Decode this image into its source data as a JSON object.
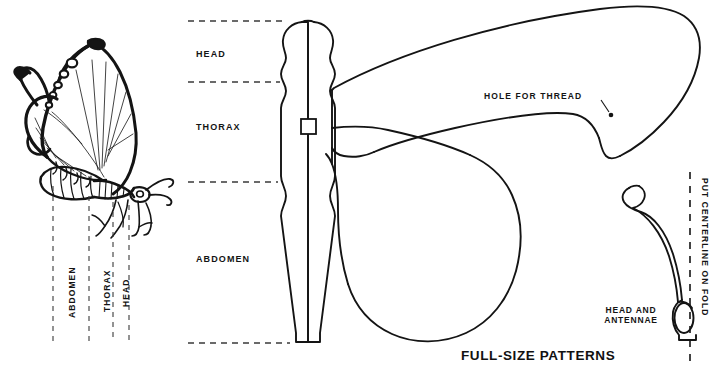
{
  "figure": {
    "title": "FULL-SIZE PATTERNS",
    "domain": "craft-sewing-pattern-diagram",
    "background_color": "#ffffff",
    "ink_color": "#141414"
  },
  "butterfly_illustration": {
    "name": "butterfly-side-view",
    "segment_labels": [
      {
        "text": "ABDOMEN",
        "orientation": "vertical"
      },
      {
        "text": "THORAX",
        "orientation": "vertical"
      },
      {
        "text": "HEAD",
        "orientation": "vertical"
      }
    ]
  },
  "body_pattern": {
    "name": "body-pattern",
    "segment_labels": [
      {
        "text": "HEAD",
        "orientation": "horizontal"
      },
      {
        "text": "THORAX",
        "orientation": "horizontal"
      },
      {
        "text": "ABDOMEN",
        "orientation": "horizontal"
      }
    ]
  },
  "wing_pattern": {
    "name": "wing-pattern",
    "annotation": "HOLE FOR THREAD"
  },
  "antennae_pattern": {
    "name": "head-and-antennae-pattern",
    "label_line_1": "HEAD AND",
    "label_line_2": "ANTENNAE"
  },
  "fold_line": {
    "name": "centerline-fold",
    "text": "PUT CENTERLINE ON FOLD"
  }
}
